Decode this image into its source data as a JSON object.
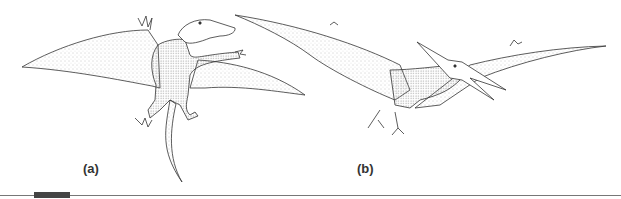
{
  "figure": {
    "panels": [
      {
        "label": "(a)",
        "subject": "early pterosaur (rhamphorhynchoid) with long tail, wings spread, viewed from above"
      },
      {
        "label": "(b)",
        "subject": "pterodactyloid pterosaur with head crest and long beak, in flight"
      }
    ],
    "colors": {
      "ink": "#333333",
      "stipple": "#888888",
      "rule": "#777777",
      "rule_block": "#444444"
    }
  }
}
